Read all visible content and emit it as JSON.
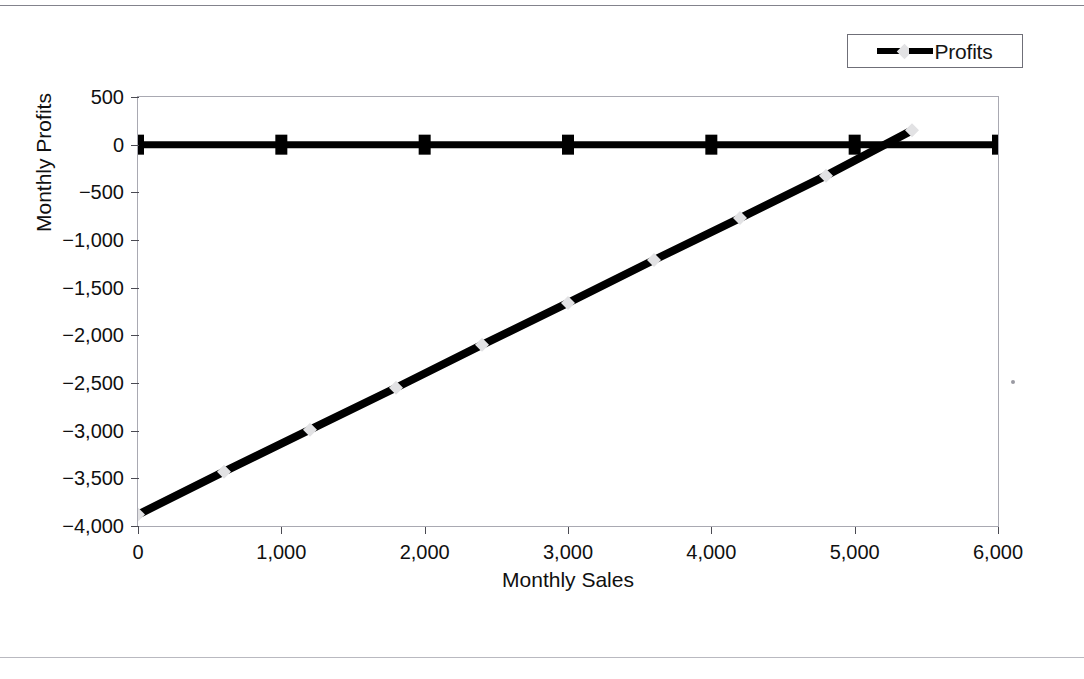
{
  "page": {
    "background": "#ffffff",
    "rule_color": "#8e8e96"
  },
  "legend": {
    "position": "top-right",
    "entries": [
      {
        "label": "Profits",
        "line_color": "#000000",
        "marker_color": "#e2e2e4",
        "marker_shape": "diamond"
      }
    ]
  },
  "chart_data": {
    "type": "line",
    "title": "",
    "subtitle": "",
    "xlabel": "Monthly Sales",
    "ylabel": "Monthly Profits",
    "xlim": [
      0,
      6000
    ],
    "ylim": [
      -4000,
      500
    ],
    "grid": false,
    "legend_position": "top-right",
    "xticks": [
      0,
      1000,
      2000,
      3000,
      4000,
      5000,
      6000
    ],
    "xticklabels": [
      "0",
      "1,000",
      "2,000",
      "3,000",
      "4,000",
      "5,000",
      "6,000"
    ],
    "yticks": [
      500,
      0,
      -500,
      -1000,
      -1500,
      -2000,
      -2500,
      -3000,
      -3500,
      -4000
    ],
    "yticklabels": [
      "500",
      "0",
      "-500",
      "-1,000",
      "-1,500",
      "-2,000",
      "-2,500",
      "-3,000",
      "-3,500",
      "-4,000"
    ],
    "series": [
      {
        "name": "Profits",
        "style": "line-with-markers",
        "color": "#000000",
        "marker_color": "#e2e2e4",
        "marker_shape": "diamond",
        "x": [
          0,
          600,
          1200,
          1800,
          2400,
          3000,
          3600,
          4200,
          4800,
          5400
        ],
        "values": [
          -3880,
          -3430,
          -2990,
          -2550,
          -2100,
          -1660,
          -1210,
          -770,
          -325,
          150
        ]
      },
      {
        "name": "Zero reference",
        "style": "line-with-markers",
        "color": "#000000",
        "marker_color": "#000000",
        "marker_shape": "square",
        "x": [
          0,
          1000,
          2000,
          3000,
          4000,
          5000,
          6000
        ],
        "values": [
          0,
          0,
          0,
          0,
          0,
          0,
          0
        ]
      }
    ],
    "annotations": [
      {
        "text": "break-even",
        "x": 5180,
        "y": 0,
        "visible": false
      }
    ]
  }
}
